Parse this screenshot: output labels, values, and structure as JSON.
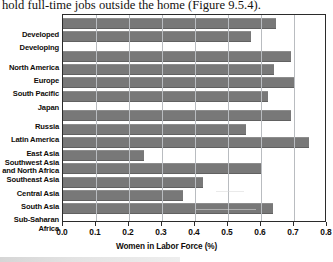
{
  "page": {
    "body_text": "hold full-time jobs outside the home (Figure 9.5.4)."
  },
  "chart_data": {
    "type": "bar",
    "orientation": "horizontal",
    "title": "",
    "xlabel": "Women in Labor Force (%)",
    "ylabel": "",
    "xlim": [
      0.0,
      0.8
    ],
    "xticks": [
      "0.0",
      "0.1",
      "0.2",
      "0.3",
      "0.4",
      "0.5",
      "0.6",
      "0.7",
      "0.8"
    ],
    "xtick_values": [
      0.0,
      0.1,
      0.2,
      0.3,
      0.4,
      0.5,
      0.6,
      0.7,
      0.8
    ],
    "grid": "vertical",
    "legend": "none",
    "bar_color": "#787878",
    "categories": [
      "Developed",
      "Developing",
      "North America",
      "Europe",
      "South Pacific",
      "Japan",
      "Russia",
      "Latin America",
      "East Asia",
      "Southwest Asia\nand North Africa",
      "Southeast Asia",
      "Central Asia",
      "South Asia",
      "Sub-Saharan Africa"
    ],
    "values": [
      0.645,
      0.57,
      0.69,
      0.64,
      0.7,
      0.62,
      0.69,
      0.555,
      0.745,
      0.245,
      0.6,
      0.425,
      0.365,
      0.635
    ],
    "group_breaks_after": [
      1,
      5
    ]
  }
}
